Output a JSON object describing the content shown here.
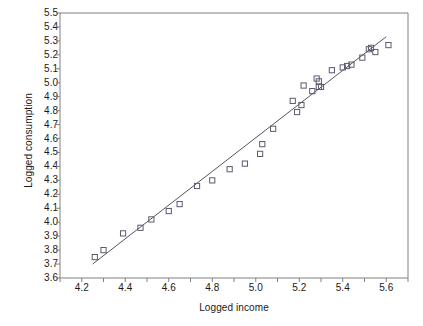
{
  "chart_data": {
    "type": "scatter",
    "title": "",
    "xlabel": "Logged income",
    "ylabel": "Logged consumption",
    "xlim": [
      4.1,
      5.7
    ],
    "ylim": [
      3.6,
      5.5
    ],
    "grid": false,
    "legend": "none",
    "marker": "open-square",
    "x_ticks": [
      4.1,
      4.2,
      4.3,
      4.4,
      4.5,
      4.6,
      4.7,
      4.8,
      4.9,
      5.0,
      5.1,
      5.2,
      5.3,
      5.4,
      5.5,
      5.6,
      5.7
    ],
    "x_tick_labels": [
      "",
      "4.2",
      "",
      "4.4",
      "",
      "4.6",
      "",
      "4.8",
      "",
      "5.0",
      "",
      "5.2",
      "",
      "5.4",
      "",
      "5.6",
      ""
    ],
    "y_ticks": [
      3.6,
      3.7,
      3.8,
      3.9,
      4.0,
      4.1,
      4.2,
      4.3,
      4.4,
      4.5,
      4.6,
      4.7,
      4.8,
      4.9,
      5.0,
      5.1,
      5.2,
      5.3,
      5.4,
      5.5
    ],
    "y_tick_labels": [
      "3.6",
      "3.7",
      "3.8",
      "3.9",
      "4.0",
      "4.1",
      "4.2",
      "4.3",
      "4.4",
      "4.5",
      "4.6",
      "4.7",
      "4.8",
      "4.9",
      "5.0",
      "5.1",
      "5.2",
      "5.3",
      "5.4",
      "5.5"
    ],
    "points": [
      {
        "x": 4.26,
        "y": 3.75
      },
      {
        "x": 4.3,
        "y": 3.8
      },
      {
        "x": 4.39,
        "y": 3.92
      },
      {
        "x": 4.47,
        "y": 3.96
      },
      {
        "x": 4.52,
        "y": 4.02
      },
      {
        "x": 4.6,
        "y": 4.08
      },
      {
        "x": 4.65,
        "y": 4.13
      },
      {
        "x": 4.73,
        "y": 4.26
      },
      {
        "x": 4.8,
        "y": 4.3
      },
      {
        "x": 4.88,
        "y": 4.38
      },
      {
        "x": 4.95,
        "y": 4.42
      },
      {
        "x": 5.02,
        "y": 4.49
      },
      {
        "x": 5.03,
        "y": 4.56
      },
      {
        "x": 5.08,
        "y": 4.67
      },
      {
        "x": 5.17,
        "y": 4.87
      },
      {
        "x": 5.19,
        "y": 4.79
      },
      {
        "x": 5.21,
        "y": 4.84
      },
      {
        "x": 5.22,
        "y": 4.98
      },
      {
        "x": 5.26,
        "y": 4.94
      },
      {
        "x": 5.28,
        "y": 5.03
      },
      {
        "x": 5.29,
        "y": 4.97
      },
      {
        "x": 5.29,
        "y": 5.01
      },
      {
        "x": 5.3,
        "y": 4.97
      },
      {
        "x": 5.35,
        "y": 5.09
      },
      {
        "x": 5.4,
        "y": 5.11
      },
      {
        "x": 5.42,
        "y": 5.12
      },
      {
        "x": 5.44,
        "y": 5.13
      },
      {
        "x": 5.49,
        "y": 5.18
      },
      {
        "x": 5.52,
        "y": 5.24
      },
      {
        "x": 5.53,
        "y": 5.25
      },
      {
        "x": 5.55,
        "y": 5.22
      },
      {
        "x": 5.61,
        "y": 5.27
      }
    ],
    "fit_line": {
      "label": "regression line",
      "x_start": 4.25,
      "y_start": 3.7,
      "x_end": 5.6,
      "y_end": 5.33
    }
  },
  "figure": {
    "frame_color": "#808080",
    "marker_color": "#5a5a6e",
    "line_color": "#55555f",
    "text_color": "#1a1a1a",
    "background": "#ffffff"
  }
}
